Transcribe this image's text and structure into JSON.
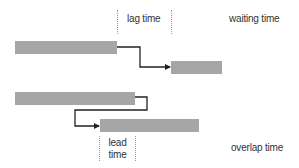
{
  "diagram": {
    "colors": {
      "bar": "#a6a6a6",
      "connector": "#222222",
      "dotted_guide": "#9a9a9a",
      "text": "#333333"
    },
    "labels": {
      "lag": "lag time",
      "waiting": "waiting time",
      "lead_line1": "lead",
      "lead_line2": "time",
      "overlap": "overlap time"
    },
    "examples": [
      {
        "name": "lag",
        "predecessor": {
          "x": 15,
          "y": 41,
          "w": 102,
          "h": 13
        },
        "successor": {
          "x": 171,
          "y": 61,
          "w": 51,
          "h": 13
        },
        "annotation": "lag time",
        "category": "waiting time"
      },
      {
        "name": "lead",
        "predecessor": {
          "x": 15,
          "y": 92,
          "w": 120,
          "h": 13
        },
        "successor": {
          "x": 100,
          "y": 119,
          "w": 99,
          "h": 13
        },
        "annotation": "lead time",
        "category": "overlap time"
      }
    ]
  }
}
